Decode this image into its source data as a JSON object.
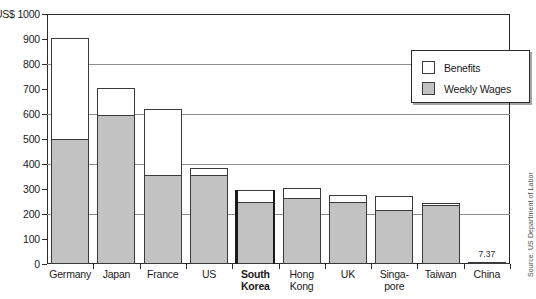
{
  "chart_data": {
    "type": "bar",
    "subtype": "stacked-vertical",
    "title": "",
    "xlabel": "",
    "ylabel": "US$",
    "ylim": [
      0,
      1000
    ],
    "yticks": [
      0,
      100,
      200,
      300,
      400,
      500,
      600,
      700,
      800,
      900,
      1000
    ],
    "ytick_labels": [
      "0",
      "100",
      "200",
      "300",
      "400",
      "500",
      "600",
      "700",
      "800",
      "900",
      "1000"
    ],
    "y_axis_unit_prefix": "US$",
    "y_axis_top_label": "US$ 1000",
    "gridlines": [
      200,
      400,
      600,
      800
    ],
    "grid": true,
    "legend_position": "top-right",
    "categories": [
      "Germany",
      "Japan",
      "France",
      "US",
      "South Korea",
      "Hong Kong",
      "UK",
      "Singapore",
      "Taiwan",
      "China"
    ],
    "category_lines": [
      [
        "Germany"
      ],
      [
        "Japan"
      ],
      [
        "France"
      ],
      [
        "US"
      ],
      [
        "South",
        "Korea"
      ],
      [
        "Hong",
        "Kong"
      ],
      [
        "UK"
      ],
      [
        "Singa-",
        "pore"
      ],
      [
        "Taiwan"
      ],
      [
        "China"
      ]
    ],
    "highlighted_category": "South Korea",
    "series": [
      {
        "name": "Weekly Wages",
        "color": "#c2c2c2",
        "values": [
          500,
          595,
          355,
          358,
          250,
          265,
          250,
          218,
          235,
          7.37
        ]
      },
      {
        "name": "Benefits",
        "color": "#ffffff",
        "values": [
          405,
          110,
          265,
          27,
          48,
          40,
          28,
          54,
          8,
          0
        ]
      }
    ],
    "totals": [
      905,
      705,
      620,
      385,
      298,
      305,
      278,
      272,
      243,
      7.37
    ],
    "data_labels": [
      {
        "category": "China",
        "text": "7.37",
        "value": 7.37
      }
    ],
    "annotations": [
      {
        "name": "source-note",
        "text": "Source: US Department of Labor",
        "position": "right-edge-vertical"
      }
    ]
  },
  "legend": {
    "items": [
      {
        "label": "Benefits",
        "swatch": "white"
      },
      {
        "label": "Weekly Wages",
        "swatch": "gray"
      }
    ]
  },
  "source": {
    "text": "Source: US Department of Labor"
  },
  "colors": {
    "wages_fill": "#c2c2c2",
    "benefits_fill": "#ffffff",
    "outline": "#3a3a3a",
    "axis": "#2b2b2b",
    "grid": "#8c8c8c",
    "text": "#1a1a1a"
  }
}
